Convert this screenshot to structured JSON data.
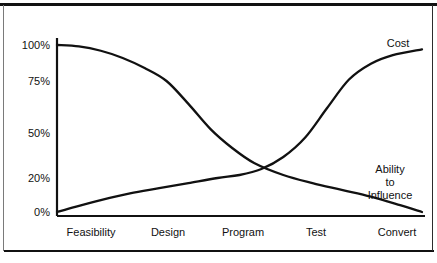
{
  "chart_data": {
    "type": "line",
    "title": "",
    "subtitle": "",
    "xlabel": "",
    "ylabel": "",
    "grid": false,
    "legend_position": "inline-end-of-line",
    "categories": [
      "Feasibility",
      "Design",
      "Program",
      "Test",
      "Convert"
    ],
    "ytick_labels": [
      "100%",
      "75%",
      "50%",
      "20%",
      "0%"
    ],
    "ytick_values": [
      100,
      75,
      50,
      20,
      0
    ],
    "ylim": [
      0,
      100
    ],
    "xlim": [
      0,
      100
    ],
    "note": "Y axis tick spacing is non-linear as drawn in the original figure.",
    "series": [
      {
        "name": "Cost",
        "label": "Cost",
        "x": [
          0,
          5,
          12,
          20,
          28,
          36,
          44,
          50,
          56,
          62,
          68,
          74,
          80,
          86,
          92,
          100
        ],
        "values": [
          0,
          3,
          7,
          11,
          14,
          17,
          20,
          22,
          26,
          34,
          47,
          62,
          76,
          87,
          93,
          97
        ]
      },
      {
        "name": "Ability to Influence",
        "label": "Ability to Influence",
        "label_lines": [
          "Ability",
          "to",
          "Influence"
        ],
        "x": [
          0,
          6,
          12,
          18,
          24,
          30,
          36,
          42,
          48,
          54,
          62,
          70,
          78,
          86,
          94,
          100
        ],
        "values": [
          100,
          99,
          96,
          91,
          84,
          75,
          64,
          52,
          40,
          30,
          22,
          17,
          13,
          9,
          4,
          0
        ]
      }
    ],
    "crossing_point": {
      "x_fraction": 0.4,
      "value": 22
    },
    "colors": {
      "line": "#111111",
      "axis": "#111111",
      "text": "#111111",
      "background": "#ffffff"
    }
  },
  "axis": {
    "y_ticks": [
      {
        "label": "100%",
        "y": 45
      },
      {
        "label": "75%",
        "y": 81
      },
      {
        "label": "50%",
        "y": 133
      },
      {
        "label": "20%",
        "y": 178
      },
      {
        "label": "0%",
        "y": 212
      }
    ],
    "x_ticks": [
      {
        "label": "Feasibility",
        "x": 91
      },
      {
        "label": "Design",
        "x": 168
      },
      {
        "label": "Program",
        "x": 243
      },
      {
        "label": "Test",
        "x": 316
      },
      {
        "label": "Convert",
        "x": 397
      }
    ]
  },
  "annotations": {
    "cost": {
      "text": "Cost",
      "x": 398,
      "y": 38
    },
    "influence_line1": {
      "text": "Ability",
      "x": 390,
      "y": 165
    },
    "influence_line2": {
      "text": "to",
      "x": 390,
      "y": 178
    },
    "influence_line3": {
      "text": "Influence",
      "x": 390,
      "y": 191
    }
  }
}
